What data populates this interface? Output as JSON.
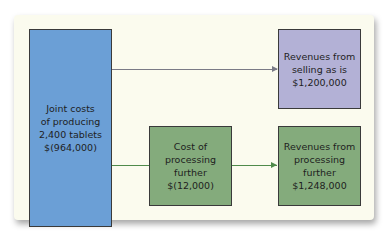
{
  "diagram": {
    "joint_costs": {
      "text": "Joint costs\nof producing\n2,400 tablets\n$(964,000)",
      "color": "#6b9fd6"
    },
    "revenue_as_is": {
      "text": "Revenues from\nselling as is\n$1,200,000",
      "color": "#b3b1d6"
    },
    "cost_processing": {
      "text": "Cost of\nprocessing\nfurther\n$(12,000)",
      "color": "#84ab7c"
    },
    "revenue_processing": {
      "text": "Revenues from\nprocessing\nfurther\n$1,248,000",
      "color": "#84ab7c"
    },
    "colors": {
      "panel": "#fbfbee",
      "connector_gray": "#7a7a86",
      "connector_green": "#4f8a4a"
    }
  }
}
